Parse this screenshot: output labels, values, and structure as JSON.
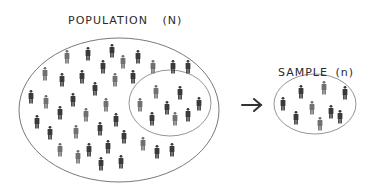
{
  "population": {
    "title": "POPULATION",
    "symbol": "(N)",
    "people": [
      [
        67,
        50
      ],
      [
        88,
        47
      ],
      [
        112,
        44
      ],
      [
        123,
        55
      ],
      [
        138,
        50
      ],
      [
        103,
        60
      ],
      [
        153,
        60
      ],
      [
        173,
        60
      ],
      [
        188,
        60
      ],
      [
        45,
        67
      ],
      [
        82,
        70
      ],
      [
        62,
        73
      ],
      [
        115,
        73
      ],
      [
        133,
        70
      ],
      [
        31,
        90
      ],
      [
        46,
        95
      ],
      [
        73,
        93
      ],
      [
        95,
        82
      ],
      [
        106,
        98
      ],
      [
        37,
        115
      ],
      [
        60,
        106
      ],
      [
        86,
        108
      ],
      [
        116,
        113
      ],
      [
        50,
        126
      ],
      [
        76,
        125
      ],
      [
        100,
        122
      ],
      [
        124,
        130
      ],
      [
        60,
        143
      ],
      [
        89,
        143
      ],
      [
        108,
        140
      ],
      [
        143,
        137
      ],
      [
        157,
        145
      ],
      [
        172,
        143
      ],
      [
        78,
        150
      ],
      [
        101,
        157
      ],
      [
        121,
        155
      ]
    ],
    "subset_people": [
      [
        156,
        85
      ],
      [
        180,
        86
      ],
      [
        199,
        97
      ],
      [
        140,
        98
      ],
      [
        167,
        101
      ],
      [
        152,
        112
      ],
      [
        175,
        112
      ],
      [
        188,
        108
      ]
    ]
  },
  "arrow": {
    "symbol": "→"
  },
  "sample": {
    "title": "SAMPLE",
    "symbol": "(n)",
    "people": [
      [
        301,
        85
      ],
      [
        324,
        81
      ],
      [
        345,
        86
      ],
      [
        283,
        97
      ],
      [
        312,
        101
      ],
      [
        331,
        105
      ],
      [
        296,
        111
      ],
      [
        320,
        117
      ],
      [
        340,
        110
      ]
    ]
  },
  "colors": {
    "outline": "#6a6a6a",
    "person_dark": "#3a3a3a",
    "person_light": "#707070"
  }
}
